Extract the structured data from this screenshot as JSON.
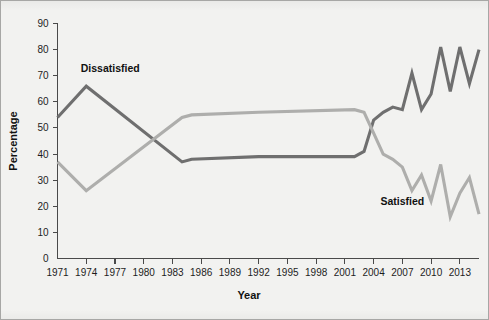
{
  "chart_data": {
    "type": "line",
    "title": "",
    "xlabel": "Year",
    "ylabel": "Percentage",
    "xlim": [
      1971,
      2015
    ],
    "ylim": [
      0,
      90
    ],
    "ytick_step": 10,
    "yticks": [
      0,
      10,
      20,
      30,
      40,
      50,
      60,
      70,
      80,
      90
    ],
    "xticks": [
      1971,
      1974,
      1977,
      1980,
      1983,
      1986,
      1989,
      1992,
      1995,
      1998,
      2001,
      2004,
      2007,
      2010,
      2013
    ],
    "grid": false,
    "legend_position": "inline-annotations",
    "x": [
      1971,
      1974,
      1984,
      1985,
      1992,
      2002,
      2003,
      2004,
      2005,
      2006,
      2007,
      2008,
      2009,
      2010,
      2011,
      2012,
      2013,
      2014,
      2015
    ],
    "series": [
      {
        "name": "Dissatisfied",
        "color": "#6f6f6f",
        "label_x": 1976.5,
        "label_y": 71.5,
        "values": [
          54,
          66,
          37,
          38,
          39,
          39,
          41,
          53,
          56,
          58,
          57,
          71,
          57,
          63,
          81,
          64,
          81,
          67,
          80
        ]
      },
      {
        "name": "Satisfied",
        "color": "#aeaeac",
        "label_x": 2007.0,
        "label_y": 20.5,
        "values": [
          37,
          26,
          54,
          55,
          56,
          57,
          56,
          48,
          40,
          38,
          35,
          26,
          32,
          22,
          36,
          16,
          25,
          31,
          17
        ]
      }
    ]
  },
  "axis": {
    "y_tick_labels": [
      "0",
      "10",
      "20",
      "30",
      "40",
      "50",
      "60",
      "70",
      "80",
      "90"
    ],
    "x_tick_labels": [
      "1971",
      "1974",
      "1977",
      "1980",
      "1983",
      "1986",
      "1989",
      "1992",
      "1995",
      "1998",
      "2001",
      "2004",
      "2007",
      "2010",
      "2013"
    ],
    "x_title": "Year",
    "y_title": "Percentage"
  },
  "annotations": {
    "dissatisfied_label": "Dissatisfied",
    "satisfied_label": "Satisfied"
  },
  "colors": {
    "background": "#f2f2f0",
    "frame": "#a7a7a5",
    "axis": "#4a4a4a",
    "dissatisfied": "#6f6f6f",
    "satisfied": "#aeaeac",
    "text": "#1d1d1d"
  }
}
